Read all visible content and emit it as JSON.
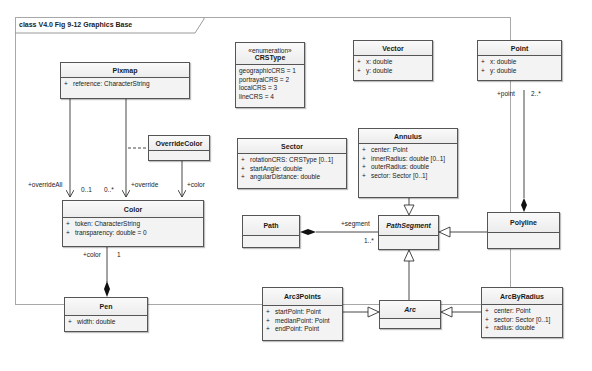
{
  "diagram": {
    "frame_title": "class V4.0 Fig 9-12 Graphics Base"
  },
  "classes": {
    "pixmap": {
      "name": "Pixmap",
      "attributes": [
        {
          "vis": "+",
          "text": "reference:  CharacterString"
        }
      ]
    },
    "crstype": {
      "stereotype": "«enumeration»",
      "name": "CRSType",
      "literals": [
        "geographicCRS = 1",
        "portrayalCRS = 2",
        "localCRS = 3",
        "lineCRS = 4"
      ]
    },
    "vector": {
      "name": "Vector",
      "attributes": [
        {
          "vis": "+",
          "text": "x:  double"
        },
        {
          "vis": "+",
          "text": "y:  double"
        }
      ]
    },
    "point": {
      "name": "Point",
      "attributes": [
        {
          "vis": "+",
          "text": "x:  double"
        },
        {
          "vis": "+",
          "text": "y:  double"
        }
      ]
    },
    "overridecolor": {
      "name": "OverrideColor",
      "attributes": []
    },
    "sector": {
      "name": "Sector",
      "attributes": [
        {
          "vis": "+",
          "text": "rotationCRS:  CRSType [0..1]"
        },
        {
          "vis": "+",
          "text": "startAngle:  double"
        },
        {
          "vis": "+",
          "text": "angularDistance:  double"
        }
      ]
    },
    "annulus": {
      "name": "Annulus",
      "attributes": [
        {
          "vis": "+",
          "text": "center:  Point"
        },
        {
          "vis": "+",
          "text": "innerRadius:  double [0..1]"
        },
        {
          "vis": "+",
          "text": "outerRadius:  double"
        },
        {
          "vis": "+",
          "text": "sector:  Sector [0..1]"
        }
      ]
    },
    "color": {
      "name": "Color",
      "attributes": [
        {
          "vis": "+",
          "text": "token:  CharacterString"
        },
        {
          "vis": "+",
          "text": "transparency:  double = 0"
        }
      ]
    },
    "path": {
      "name": "Path",
      "attributes": []
    },
    "pathsegment": {
      "name": "PathSegment",
      "abstract": true,
      "attributes": []
    },
    "polyline": {
      "name": "Polyline",
      "attributes": []
    },
    "pen": {
      "name": "Pen",
      "attributes": [
        {
          "vis": "+",
          "text": "width:  double"
        }
      ]
    },
    "arc3points": {
      "name": "Arc3Points",
      "attributes": [
        {
          "vis": "+",
          "text": "startPoint:  Point"
        },
        {
          "vis": "+",
          "text": "medianPoint:  Point"
        },
        {
          "vis": "+",
          "text": "endPoint:  Point"
        }
      ]
    },
    "arc": {
      "name": "Arc",
      "abstract": true,
      "attributes": []
    },
    "arcbyradius": {
      "name": "ArcByRadius",
      "attributes": [
        {
          "vis": "+",
          "text": "center:  Point"
        },
        {
          "vis": "+",
          "text": "sector:  Sector [0..1]"
        },
        {
          "vis": "+",
          "text": "radius:  double"
        }
      ]
    }
  },
  "labels": {
    "override_all_role": "+overrideAll",
    "override_all_mult": "0..1",
    "override_mult": "0..*",
    "override_role": "+override",
    "color_role_top": "+color",
    "pen_color_role": "+color",
    "pen_color_mult": "1",
    "point_role": "+point",
    "point_mult": "2..*",
    "segment_role": "+segment",
    "segment_mult": "1..*"
  }
}
